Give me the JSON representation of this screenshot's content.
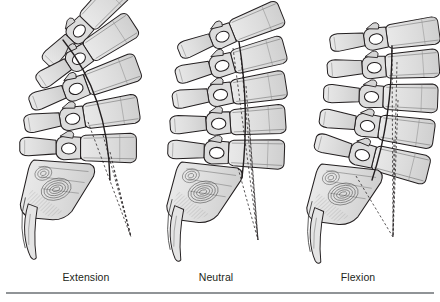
{
  "figure": {
    "panel_count": 3,
    "background_color": "#ffffff",
    "bone_fill_color": "#d9d9d9",
    "bone_fill_color_light": "#e6e6e6",
    "outline_color": "#231f20",
    "foramen_color": "#ffffff",
    "caption_color": "#231f20",
    "rule_color": "#909497",
    "line_label_solid": "solid posterior alignment line",
    "line_label_dashed": "dashed endplate convergence lines"
  },
  "panels": [
    {
      "id": "panel-extension",
      "label": "Extension",
      "label_center_x": 86,
      "vertebra_count": 5,
      "curve": "lordotic",
      "convergence": "narrow",
      "origin_x": 10
    },
    {
      "id": "panel-neutral",
      "label": "Neutral",
      "label_center_x": 216,
      "vertebra_count": 5,
      "curve": "neutral",
      "convergence": "moderate",
      "origin_x": 152
    },
    {
      "id": "panel-flexion",
      "label": "Flexion",
      "label_center_x": 358,
      "vertebra_count": 5,
      "curve": "kyphotic",
      "convergence": "wide",
      "origin_x": 292
    }
  ],
  "captions": {
    "extension": "Extension",
    "neutral": "Neutral",
    "flexion": "Flexion"
  }
}
